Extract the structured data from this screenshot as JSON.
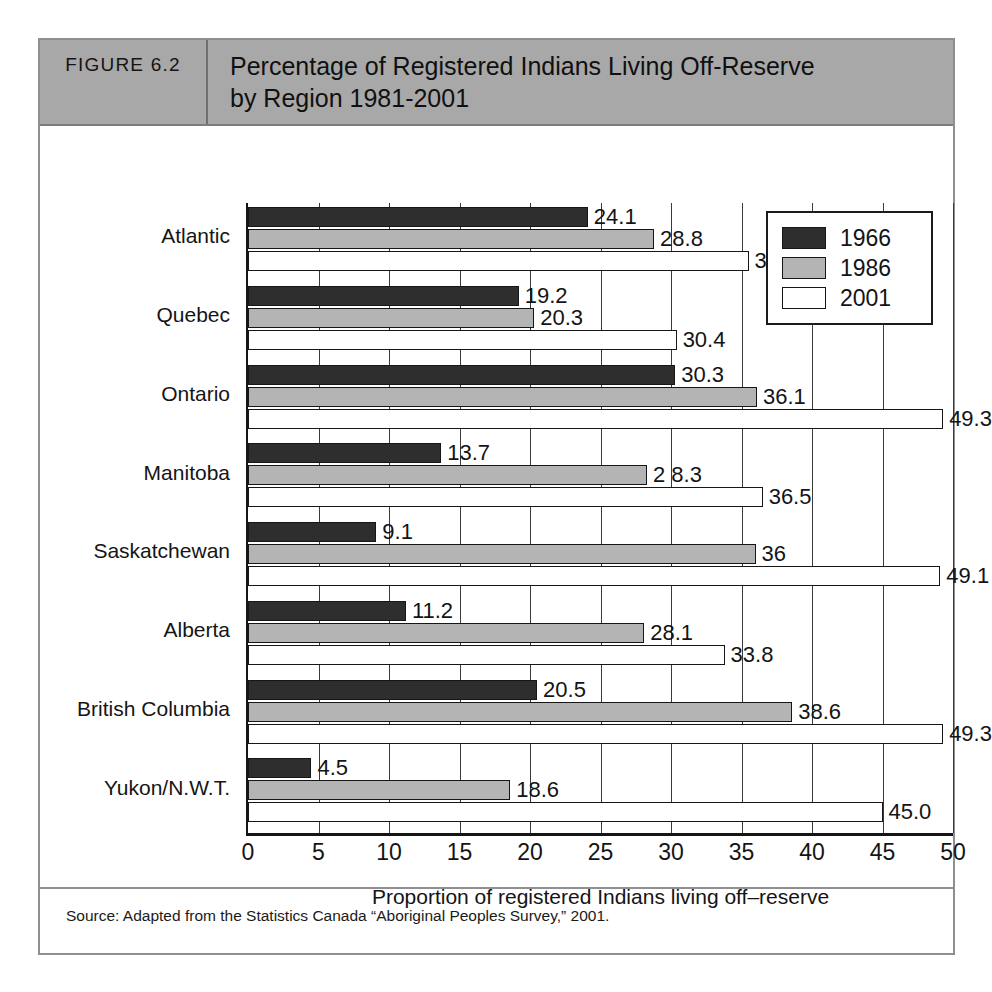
{
  "figure": {
    "number_label": "FIGURE 6.2",
    "title_line1": "Percentage of Registered Indians Living Off-Reserve",
    "title_line2": "by Region 1981-2001",
    "source": "Source: Adapted from the Statistics Canada “Aboriginal Peoples Survey,” 2001."
  },
  "colors": {
    "header_band": "#a8a8a8",
    "series_1966": "#2e2e2e",
    "series_1986": "#b4b4b4",
    "series_2001": "#ffffff",
    "axis": "#151515",
    "frame": "#8f8f8f"
  },
  "legend": {
    "items": [
      {
        "label": "1966",
        "swatch": "series-1966"
      },
      {
        "label": "1986",
        "swatch": "series-1986"
      },
      {
        "label": "2001",
        "swatch": "series-2001"
      }
    ]
  },
  "chart_data": {
    "type": "bar",
    "orientation": "horizontal",
    "title": "Percentage of Registered Indians Living Off-Reserve by Region 1981-2001",
    "xlabel": "Proportion of registered Indians living off–reserve",
    "ylabel": "",
    "xlim": [
      0,
      50
    ],
    "xticks": [
      0,
      5,
      10,
      15,
      20,
      25,
      30,
      35,
      40,
      45,
      50
    ],
    "xtick_labels": [
      "0",
      "5",
      "10",
      "15",
      "20",
      "25",
      "30",
      "35",
      "40",
      "45",
      "50"
    ],
    "grid": true,
    "legend_position": "top-right",
    "categories": [
      "Atlantic",
      "Quebec",
      "Ontario",
      "Manitoba",
      "Saskatchewan",
      "Alberta",
      "British Columbia",
      "Yukon/N.W.T."
    ],
    "series": [
      {
        "name": "1966",
        "values": [
          24.1,
          19.2,
          30.3,
          13.7,
          9.1,
          11.2,
          20.5,
          4.5
        ],
        "labels": [
          "24.1",
          "19.2",
          "30.3",
          "13.7",
          "9.1",
          "11.2",
          "20.5",
          "4.5"
        ]
      },
      {
        "name": "1986",
        "values": [
          28.8,
          20.3,
          36.1,
          28.3,
          36,
          28.1,
          38.6,
          18.6
        ],
        "labels": [
          "28.8",
          "20.3",
          "36.1",
          "2 8.3",
          "36",
          "28.1",
          "38.6",
          "18.6"
        ]
      },
      {
        "name": "2001",
        "values": [
          35.5,
          30.4,
          49.3,
          36.5,
          49.1,
          33.8,
          49.3,
          45.0
        ],
        "labels": [
          "35.5",
          "30.4",
          "49.3",
          "36.5",
          "49.1",
          "33.8",
          "49.3",
          "45.0"
        ]
      }
    ]
  }
}
